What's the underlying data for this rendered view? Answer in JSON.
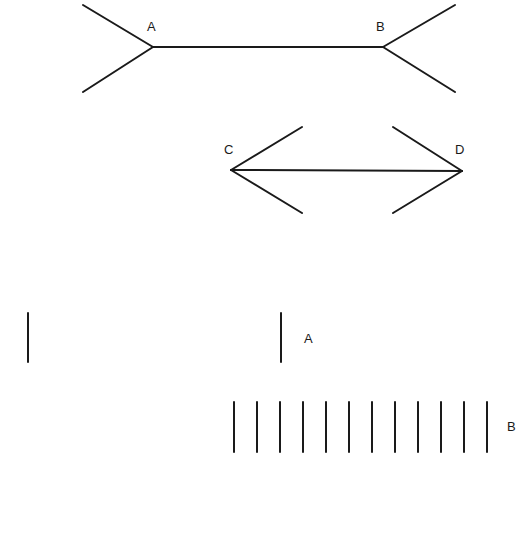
{
  "figure": {
    "type": "Muller-Lyer illusion",
    "stroke_color": "#1a1a1a",
    "background": "#ffffff"
  },
  "top_figure": {
    "labels": {
      "left": "A",
      "right": "B"
    },
    "shaft": {
      "x1": 153,
      "y1": 47,
      "x2": 383,
      "y2": 47
    },
    "fins": [
      {
        "x1": 153,
        "y1": 47,
        "x2": 83,
        "y2": 5
      },
      {
        "x1": 153,
        "y1": 47,
        "x2": 83,
        "y2": 92
      },
      {
        "x1": 383,
        "y1": 47,
        "x2": 455,
        "y2": 5
      },
      {
        "x1": 383,
        "y1": 47,
        "x2": 455,
        "y2": 92
      }
    ]
  },
  "middle_figure": {
    "labels": {
      "left": "C",
      "right": "D"
    },
    "shaft": {
      "x1": 231,
      "y1": 170,
      "x2": 462,
      "y2": 171
    },
    "fins": [
      {
        "x1": 231,
        "y1": 170,
        "x2": 302,
        "y2": 127
      },
      {
        "x1": 231,
        "y1": 170,
        "x2": 302,
        "y2": 213
      },
      {
        "x1": 462,
        "y1": 171,
        "x2": 393,
        "y2": 127
      },
      {
        "x1": 462,
        "y1": 171,
        "x2": 393,
        "y2": 213
      }
    ]
  },
  "row_a": {
    "label": "A",
    "lines_x": [
      28,
      281
    ],
    "y1": 313,
    "y2": 362
  },
  "row_b": {
    "label": "B",
    "lines_x": [
      234,
      257,
      280,
      303,
      326,
      349,
      372,
      395,
      418,
      441,
      464,
      487
    ],
    "y1": 402,
    "y2": 452
  }
}
